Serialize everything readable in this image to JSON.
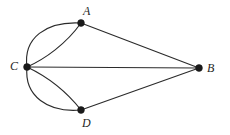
{
  "figure": {
    "name": "multigraph-diagram",
    "background_color": "#ffffff",
    "stroke_color": "#2b2b2b",
    "vertex_color": "#1a1a1a",
    "width": 230,
    "height": 135
  },
  "vertices": [
    {
      "id": "A",
      "label": "A",
      "x": 81,
      "y": 23,
      "r": 3.4,
      "label_x": 83,
      "label_y": 5
    },
    {
      "id": "B",
      "label": "B",
      "x": 199,
      "y": 68,
      "r": 3.4,
      "label_x": 207,
      "label_y": 62
    },
    {
      "id": "C",
      "label": "C",
      "x": 27,
      "y": 67,
      "r": 3.4,
      "label_x": 10,
      "label_y": 60
    },
    {
      "id": "D",
      "label": "D",
      "x": 81,
      "y": 110,
      "r": 3.4,
      "label_x": 82,
      "label_y": 117
    }
  ],
  "edges": [
    {
      "id": "CA-upper",
      "from": "C",
      "to": "A",
      "shape": "arc",
      "path": "M 27 67 C 23 38 46 21 81 23"
    },
    {
      "id": "CA-lower",
      "from": "C",
      "to": "A",
      "shape": "arc",
      "path": "M 27 67 C 45 59 66 44 81 23"
    },
    {
      "id": "CD-lower",
      "from": "C",
      "to": "D",
      "shape": "arc",
      "path": "M 27 67 C 24 96 48 113 81 110"
    },
    {
      "id": "CD-upper",
      "from": "C",
      "to": "D",
      "shape": "arc",
      "path": "M 27 67 C 46 76 66 91 81 110"
    },
    {
      "id": "CB",
      "from": "C",
      "to": "B",
      "shape": "line",
      "path": "M 27 67 L 199 68"
    },
    {
      "id": "AB",
      "from": "A",
      "to": "B",
      "shape": "line",
      "path": "M 81 23 L 199 68"
    },
    {
      "id": "DB",
      "from": "D",
      "to": "B",
      "shape": "line",
      "path": "M 81 110 L 199 68"
    }
  ],
  "chart_data": {
    "type": "graph",
    "title": "",
    "nodes": [
      "A",
      "B",
      "C",
      "D"
    ],
    "edge_list": [
      [
        "C",
        "A"
      ],
      [
        "C",
        "A"
      ],
      [
        "C",
        "D"
      ],
      [
        "C",
        "D"
      ],
      [
        "C",
        "B"
      ],
      [
        "A",
        "B"
      ],
      [
        "D",
        "B"
      ]
    ],
    "degrees": {
      "A": 3,
      "B": 3,
      "C": 5,
      "D": 3
    },
    "multi_edges": {
      "C-A": 2,
      "C-D": 2
    },
    "edge_count": 7
  }
}
